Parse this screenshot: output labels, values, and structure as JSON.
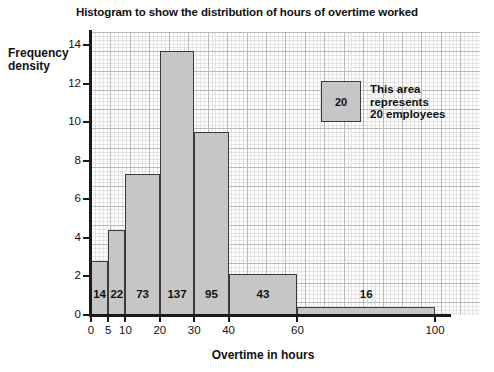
{
  "chart_data": {
    "type": "bar",
    "title": "Histogram to show the distribution of hours of overtime worked",
    "xlabel": "Overtime in hours",
    "ylabel": "Frequency\ndensity",
    "xlim": [
      0,
      100
    ],
    "ylim": [
      0,
      14
    ],
    "grid": true,
    "x_ticks": [
      0,
      5,
      10,
      20,
      30,
      40,
      60,
      100
    ],
    "x_tick_labels": [
      "0",
      "5",
      "10",
      "20",
      "30",
      "40",
      "60",
      "100"
    ],
    "y_ticks": [
      0,
      2,
      4,
      6,
      8,
      10,
      12,
      14
    ],
    "y_tick_labels": [
      "0",
      "2",
      "4",
      "6",
      "8",
      "10",
      "12",
      "14"
    ],
    "bins": [
      {
        "start": 0,
        "end": 5,
        "frequency": 14,
        "frequency_density": 2.8,
        "label": "14"
      },
      {
        "start": 5,
        "end": 10,
        "frequency": 22,
        "frequency_density": 4.4,
        "label": "22"
      },
      {
        "start": 10,
        "end": 20,
        "frequency": 73,
        "frequency_density": 7.3,
        "label": "73"
      },
      {
        "start": 20,
        "end": 30,
        "frequency": 137,
        "frequency_density": 13.7,
        "label": "137"
      },
      {
        "start": 30,
        "end": 40,
        "frequency": 95,
        "frequency_density": 9.5,
        "label": "95"
      },
      {
        "start": 40,
        "end": 60,
        "frequency": 43,
        "frequency_density": 2.15,
        "label": "43"
      },
      {
        "start": 60,
        "end": 100,
        "frequency": 16,
        "frequency_density": 0.4,
        "label": "16"
      }
    ],
    "bar_fill_color": "#c6c6c6",
    "bar_edge_color": "#3a3a3a",
    "grid_color": "#b9b9b9",
    "axis_color": "#1a1a1a"
  },
  "legend": {
    "swatch_value": "20",
    "description": "This area\nrepresents\n20 employees"
  }
}
